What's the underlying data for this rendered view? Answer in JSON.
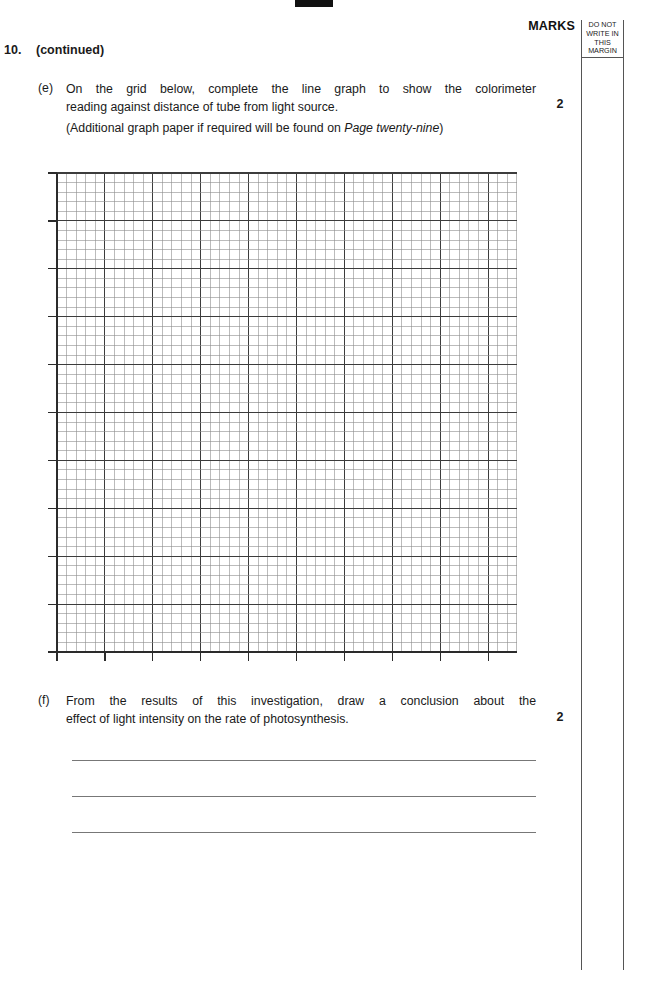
{
  "page": {
    "marks_header": "MARKS",
    "margin_note_lines": [
      "DO NOT",
      "WRITE IN",
      "THIS",
      "MARGIN"
    ]
  },
  "question": {
    "number": "10.",
    "status": "(continued)"
  },
  "parts": [
    {
      "letter": "(e)",
      "text": "On the grid below, complete the line graph to show the colorimeter reading against distance of tube from light source.",
      "text_line1": "On the grid below, complete the line graph to show the colorimeter",
      "text_line2": "reading against distance of tube from light source.",
      "note_prefix": "(Additional graph paper if required will be found on ",
      "note_italic": "Page twenty-nine",
      "note_suffix": ")",
      "marks": "2"
    },
    {
      "letter": "(f)",
      "text": "From the results of this investigation, draw a conclusion about the effect of light intensity on the rate of photosynthesis.",
      "text_line1": "From the results of this investigation, draw a conclusion about the",
      "text_line2": "effect of light intensity on the rate of photosynthesis.",
      "marks": "2"
    }
  ],
  "chart_data": {
    "type": "table",
    "title": "",
    "xlabel": "",
    "ylabel": "",
    "grid": {
      "origin_x": 57,
      "origin_y": 173,
      "width": 460,
      "height": 479,
      "minor_step": 9.58,
      "major_every": 5,
      "minor_cols": 48,
      "minor_rows": 50,
      "minor_color": "#8d8d8d",
      "major_color": "#3c3c3c",
      "tick_length": 9,
      "axis_color": "#2b2b2b"
    },
    "categories": [],
    "values": [],
    "series": []
  },
  "answer_lines": [
    "",
    "",
    ""
  ],
  "colors": {
    "ink": "#1a1a1a",
    "rule": "#777777",
    "margin_rule": "#555555",
    "registration_bar": "#111111"
  }
}
